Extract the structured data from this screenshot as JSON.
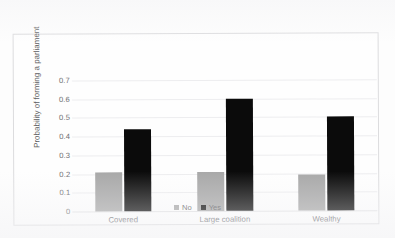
{
  "chart_data": {
    "type": "bar",
    "title": "",
    "xlabel": "",
    "ylabel": "Probability of forming a parliament",
    "categories": [
      "Covered",
      "Large coalition",
      "Wealthy"
    ],
    "series": [
      {
        "name": "No",
        "color": "#a8a8a8",
        "values": [
          0.21,
          0.21,
          0.19
        ]
      },
      {
        "name": "Yes",
        "color": "#0b0b0b",
        "values": [
          0.44,
          0.6,
          0.5
        ]
      }
    ],
    "ylim": [
      0,
      0.7
    ],
    "ytick_labels": [
      "0.7",
      "0.6",
      "0.5",
      "0.4",
      "0.3",
      "0.2",
      "0.1",
      "0"
    ],
    "ytick_values": [
      0.7,
      0.6,
      0.5,
      0.4,
      0.3,
      0.2,
      0.1,
      0
    ],
    "grid": true,
    "legend_position": "bottom"
  },
  "legend": {
    "entries": [
      {
        "label": "No"
      },
      {
        "label": "Yes"
      }
    ]
  }
}
